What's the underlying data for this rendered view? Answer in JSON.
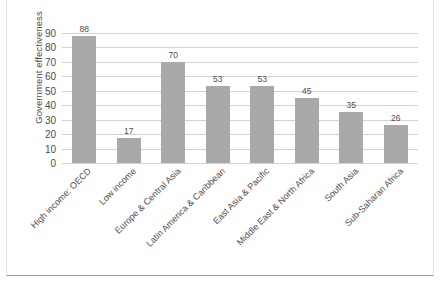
{
  "chart_data": {
    "type": "bar",
    "title": "",
    "xlabel": "",
    "ylabel": "Government effectiveness",
    "ylim": [
      0,
      90
    ],
    "ytick_step": 10,
    "grid": true,
    "legend": "none",
    "bar_color": "#a9a9a9",
    "gridline_color": "#d2d2d2",
    "text_color": "#4d4d4d",
    "yticks": [
      "90",
      "80",
      "70",
      "60",
      "50",
      "40",
      "30",
      "20",
      "10",
      "0"
    ],
    "categories": [
      "High income: OECD",
      "Low income",
      "Europe & Central Asia",
      "Latin America & Caribbean",
      "East Asia & Pacific",
      "Middle East & North Africa",
      "South Asia",
      "Sub-Saharan Africa"
    ],
    "values": [
      88,
      17,
      70,
      53,
      53,
      45,
      35,
      26
    ],
    "value_labels": [
      "88",
      "17",
      "70",
      "53",
      "53",
      "45",
      "35",
      "26"
    ]
  }
}
